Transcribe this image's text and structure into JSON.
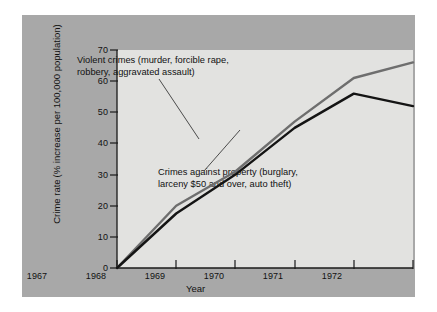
{
  "figure": {
    "background_color": "#a8a8a8",
    "plot_background_color": "#e2e2e0",
    "page_background_color": "#ffffff"
  },
  "chart_data": {
    "type": "line",
    "title": "",
    "xlabel": "Year",
    "ylabel": "Crime rate (% increase per 100,000 population)",
    "ylabel_line1": "Crime rate",
    "ylabel_line2": "(% increase per 100,000 population)",
    "x": [
      "1967",
      "1968",
      "1969",
      "1970",
      "1971",
      "1972"
    ],
    "categories": [
      "1967",
      "1968",
      "1969",
      "1970",
      "1971",
      "1972"
    ],
    "xlim": [
      1967,
      1972
    ],
    "ylim": [
      0,
      70
    ],
    "yticks": [
      0,
      10,
      20,
      30,
      40,
      50,
      60,
      70
    ],
    "ytick_labels": [
      "0",
      "10",
      "20",
      "30",
      "40",
      "50",
      "60",
      "70"
    ],
    "grid": false,
    "legend": "annotations",
    "series": [
      {
        "name": "Violent crimes (murder, forcible rape, robbery, aggravated assault)",
        "color": "#6e6e6e",
        "values": [
          0,
          20,
          31,
          47,
          61,
          66
        ]
      },
      {
        "name": "Crimes against property (burglary, larceny $50 and over, auto theft)",
        "color": "#141414",
        "values": [
          0,
          17.5,
          30,
          45,
          56,
          52
        ]
      }
    ],
    "annotations": [
      {
        "id": "violent-crimes-annotation",
        "line1": "Violent crimes (murder, forcible rape,",
        "line2": "robbery, aggravated assault)",
        "target_series": "Violent crimes (murder, forcible rape, robbery, aggravated assault)"
      },
      {
        "id": "property-crimes-annotation",
        "line1": "Crimes against property (burglary,",
        "line2": "larceny $50 and over, auto theft)",
        "target_series": "Crimes against property (burglary, larceny $50 and over, auto theft)"
      }
    ]
  }
}
